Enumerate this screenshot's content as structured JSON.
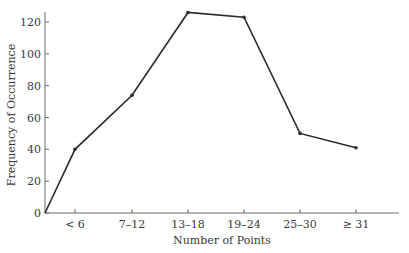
{
  "chart_data": {
    "type": "line",
    "title": "",
    "xlabel": "Number of Points",
    "ylabel": "Frequency of Occurrence",
    "categories": [
      "< 6",
      "7–12",
      "13–18",
      "19–24",
      "25–30",
      "≥ 31"
    ],
    "series": [
      {
        "name": "Frequency",
        "values": [
          40,
          74,
          126,
          123,
          50,
          41
        ],
        "start_at_origin": true
      }
    ],
    "ylim": [
      0,
      120
    ],
    "yticks": [
      0,
      20,
      40,
      60,
      80,
      100,
      120
    ],
    "grid": false,
    "legend": null,
    "line_color": "#2b2b2b"
  }
}
